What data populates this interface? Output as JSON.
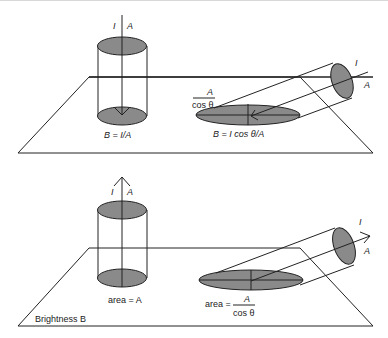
{
  "figure": {
    "top_panel": {
      "vertical_beam": {
        "label_I": "I",
        "label_A": "A",
        "equation": "B = I/A"
      },
      "tilted_beam": {
        "label_I": "I",
        "label_A": "A",
        "area_numerator": "A",
        "area_denominator": "cos θ",
        "equation": "B = I cos θ/A"
      }
    },
    "bottom_panel": {
      "vertical_beam": {
        "label_I": "I",
        "label_A": "A",
        "area_label": "area = A"
      },
      "tilted_beam": {
        "label_I": "I",
        "label_A": "A",
        "area_prefix": "area =",
        "area_numerator": "A",
        "area_denominator": "cos θ"
      },
      "plane_label": "Brightness B"
    },
    "colors": {
      "ellipse_fill": "#8a8a8a",
      "line": "#222222"
    }
  }
}
